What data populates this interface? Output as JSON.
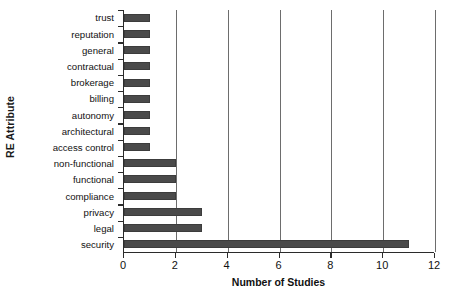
{
  "chart_data": {
    "type": "bar",
    "orientation": "horizontal",
    "title": "",
    "xlabel": "Number of Studies",
    "ylabel": "RE Attribute",
    "xlim": [
      0,
      12
    ],
    "xticks": [
      0,
      2,
      4,
      6,
      8,
      10,
      12
    ],
    "grid": "vertical",
    "legend": "none",
    "bar_color": "#4a4a4a",
    "categories": [
      "trust",
      "reputation",
      "general",
      "contractual",
      "brokerage",
      "billing",
      "autonomy",
      "architectural",
      "access control",
      "non-functional",
      "functional",
      "compliance",
      "privacy",
      "legal",
      "security"
    ],
    "values": [
      1,
      1,
      1,
      1,
      1,
      1,
      1,
      1,
      1,
      2,
      2,
      2,
      3,
      3,
      11
    ]
  }
}
